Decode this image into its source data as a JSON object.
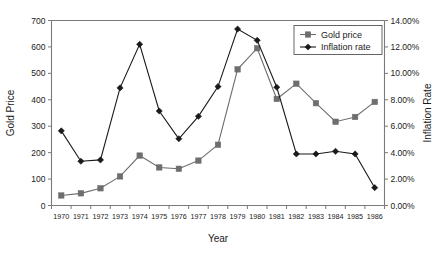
{
  "chart_data": {
    "type": "line",
    "title": "",
    "xlabel": "Year",
    "ylabel": "Gold Price",
    "y2label": "Inflation Rate",
    "categories": [
      1970,
      1971,
      1972,
      1973,
      1974,
      1975,
      1976,
      1977,
      1978,
      1979,
      1980,
      1981,
      1982,
      1983,
      1984,
      1985,
      1986
    ],
    "x_tick_labels": [
      "1970",
      "1971",
      "1972",
      "1973",
      "1974",
      "1975",
      "1976",
      "1977",
      "1978",
      "1979",
      "1980",
      "1981",
      "1982",
      "1983",
      "1984",
      "1985",
      "1986"
    ],
    "y_tick_labels": [
      "0",
      "100",
      "200",
      "300",
      "400",
      "500",
      "600",
      "700"
    ],
    "y_tick_values": [
      0,
      100,
      200,
      300,
      400,
      500,
      600,
      700
    ],
    "ylim": [
      0,
      700
    ],
    "y2_tick_labels": [
      "0.00%",
      "2.00%",
      "4.00%",
      "6.00%",
      "8.00%",
      "10.00%",
      "12.00%",
      "14.00%"
    ],
    "y2_tick_values": [
      0,
      2,
      4,
      6,
      8,
      10,
      12,
      14
    ],
    "y2lim": [
      0,
      14
    ],
    "grid": false,
    "legend_position": "top-right",
    "series": [
      {
        "name": "Gold price",
        "axis": "left",
        "color": "#6e6e6e",
        "marker": "square",
        "values": [
          38,
          46,
          65,
          110,
          189,
          144,
          139,
          170,
          230,
          515,
          595,
          403,
          461,
          387,
          317,
          335,
          392
        ]
      },
      {
        "name": "Inflation rate",
        "axis": "right",
        "color": "#1a1a1a",
        "marker": "diamond",
        "values": [
          5.65,
          3.35,
          3.45,
          8.9,
          12.2,
          7.15,
          5.05,
          6.75,
          9.0,
          13.35,
          12.5,
          8.95,
          3.9,
          3.9,
          4.1,
          3.9,
          1.35
        ]
      }
    ],
    "legend": [
      {
        "label": "Gold price",
        "color": "#6e6e6e",
        "marker": "square"
      },
      {
        "label": "Inflation rate",
        "color": "#1a1a1a",
        "marker": "diamond"
      }
    ]
  }
}
